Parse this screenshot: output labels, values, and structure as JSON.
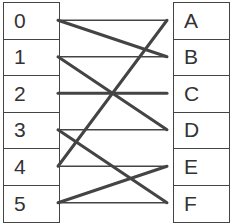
{
  "left_items": [
    "0",
    "1",
    "2",
    "3",
    "4",
    "5"
  ],
  "right_items": [
    "A",
    "B",
    "C",
    "D",
    "E",
    "F"
  ],
  "line_color": "#444444",
  "connections": [
    {
      "from": "0",
      "to": "A",
      "weight": "thin"
    },
    {
      "from": "0",
      "to": "B",
      "weight": "thick"
    },
    {
      "from": "1",
      "to": "B",
      "weight": "thin"
    },
    {
      "from": "1",
      "to": "D",
      "weight": "thick"
    },
    {
      "from": "2",
      "to": "C",
      "weight": "thick"
    },
    {
      "from": "3",
      "to": "D",
      "weight": "thin"
    },
    {
      "from": "3",
      "to": "F",
      "weight": "thick"
    },
    {
      "from": "4",
      "to": "A",
      "weight": "thick"
    },
    {
      "from": "4",
      "to": "E",
      "weight": "thin"
    },
    {
      "from": "5",
      "to": "E",
      "weight": "thick"
    },
    {
      "from": "5",
      "to": "F",
      "weight": "thin"
    }
  ]
}
